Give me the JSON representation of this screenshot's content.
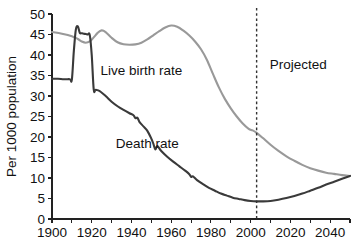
{
  "chart_data": {
    "type": "line",
    "title": "",
    "xlabel": "",
    "ylabel": "Per 1000 population",
    "xlim": [
      1900,
      2050
    ],
    "ylim": [
      0,
      50
    ],
    "grid": false,
    "legend_position": "inline-annotations",
    "x_ticks": [
      1900,
      1910,
      1920,
      1930,
      1940,
      1950,
      1960,
      1970,
      1980,
      1990,
      2000,
      2010,
      2020,
      2030,
      2040,
      2050
    ],
    "x_tick_labels": [
      "1900",
      "",
      "1920",
      "",
      "1940",
      "",
      "1960",
      "",
      "1980",
      "",
      "2000",
      "",
      "2020",
      "",
      "2040",
      ""
    ],
    "y_ticks": [
      0,
      5,
      10,
      15,
      20,
      25,
      30,
      35,
      40,
      45,
      50
    ],
    "y_tick_labels": [
      "0",
      "5",
      "10",
      "15",
      "20",
      "25",
      "30",
      "35",
      "40",
      "45",
      "50"
    ],
    "series": [
      {
        "name": "Live birth rate",
        "color": "#999999",
        "width": 2.1,
        "label_x": 1945,
        "label_y": 35.2,
        "x": [
          1900,
          1905,
          1910,
          1913,
          1915,
          1917,
          1919,
          1921,
          1923,
          1925,
          1927,
          1930,
          1933,
          1936,
          1939,
          1942,
          1945,
          1948,
          1951,
          1954,
          1957,
          1960,
          1963,
          1966,
          1969,
          1972,
          1975,
          1978,
          1981,
          1984,
          1987,
          1990,
          1993,
          1996,
          1999,
          2001,
          2003,
          2006,
          2010,
          2014,
          2018,
          2022,
          2026,
          2030,
          2034,
          2038,
          2042,
          2046,
          2050
        ],
        "y": [
          45.6,
          45.2,
          44.6,
          43.9,
          43.3,
          43.0,
          43.3,
          44.3,
          45.4,
          46.0,
          45.6,
          44.2,
          43.1,
          42.6,
          42.5,
          42.6,
          43.0,
          43.8,
          44.8,
          45.8,
          46.7,
          47.2,
          46.9,
          46.0,
          44.8,
          43.3,
          41.4,
          38.8,
          35.4,
          32.1,
          29.3,
          27.0,
          25.0,
          23.3,
          22.0,
          21.6,
          21.0,
          19.8,
          18.1,
          16.6,
          15.3,
          14.2,
          13.2,
          12.4,
          11.8,
          11.3,
          11.0,
          10.7,
          10.5
        ]
      },
      {
        "name": "Death rate",
        "color": "#3a3a3a",
        "width": 2.1,
        "label_x": 1948,
        "label_y": 17.3,
        "x": [
          1900,
          1903,
          1906,
          1909,
          1910,
          1911,
          1912,
          1913,
          1914,
          1915,
          1916,
          1917,
          1918,
          1919,
          1920,
          1921,
          1922,
          1924,
          1927,
          1930,
          1933,
          1936,
          1939,
          1941,
          1942,
          1943,
          1944,
          1946,
          1948,
          1950,
          1951,
          1952,
          1953,
          1955,
          1958,
          1961,
          1964,
          1967,
          1969,
          1970,
          1971,
          1973,
          1976,
          1979,
          1982,
          1985,
          1988,
          1991,
          1994,
          1997,
          2000,
          2003,
          2006,
          2010,
          2014,
          2018,
          2022,
          2026,
          2030,
          2034,
          2038,
          2042,
          2046,
          2050
        ],
        "y": [
          34.2,
          34.2,
          34.1,
          34.1,
          34.0,
          41.0,
          46.2,
          47.0,
          45.4,
          45.3,
          45.2,
          45.1,
          45.0,
          44.9,
          40.0,
          31.6,
          31.5,
          31.2,
          30.0,
          28.6,
          27.5,
          26.6,
          25.8,
          25.3,
          24.6,
          24.7,
          23.7,
          22.6,
          21.5,
          19.6,
          18.4,
          17.0,
          17.8,
          16.6,
          15.2,
          14.0,
          12.9,
          11.8,
          11.0,
          10.3,
          10.4,
          9.5,
          8.5,
          7.6,
          6.9,
          6.2,
          5.7,
          5.2,
          4.9,
          4.6,
          4.4,
          4.3,
          4.3,
          4.4,
          4.7,
          5.1,
          5.6,
          6.2,
          6.9,
          7.6,
          8.4,
          9.1,
          9.8,
          10.5
        ]
      }
    ],
    "annotations": [
      {
        "name": "projected-label",
        "text": "Projected",
        "x": 2024,
        "y": 36.5
      }
    ],
    "markers": [
      {
        "name": "projection-divider",
        "type": "vline",
        "x": 2003,
        "style": "dashed",
        "color": "#333333"
      }
    ]
  }
}
